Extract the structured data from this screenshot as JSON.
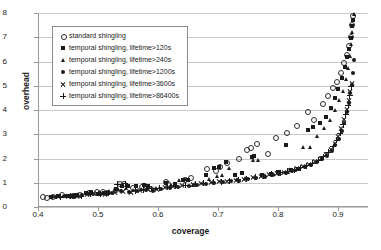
{
  "chart_data": {
    "type": "scatter",
    "title": "",
    "xlabel": "coverage",
    "ylabel": "overhead",
    "xlim": [
      0.4,
      0.95
    ],
    "ylim": [
      0,
      8
    ],
    "xticks": [
      "0.4",
      "0.5",
      "0.6",
      "0.7",
      "0.8",
      "0.9"
    ],
    "xtick_values": [
      0.4,
      0.5,
      0.6,
      0.7,
      0.8,
      0.9
    ],
    "yticks": [
      "0",
      "1",
      "2",
      "3",
      "4",
      "5",
      "6",
      "7",
      "8"
    ],
    "ytick_values": [
      0,
      1,
      2,
      3,
      4,
      5,
      6,
      7,
      8
    ],
    "grid": "horizontal",
    "legend_position": "upper-left-inside",
    "series": [
      {
        "name": "standard shingling",
        "marker": "circle-open",
        "color": "#1a1a1a",
        "points": [
          [
            0.405,
            0.42
          ],
          [
            0.413,
            0.4
          ],
          [
            0.422,
            0.45
          ],
          [
            0.437,
            0.5
          ],
          [
            0.455,
            0.47
          ],
          [
            0.468,
            0.52
          ],
          [
            0.482,
            0.58
          ],
          [
            0.495,
            0.62
          ],
          [
            0.505,
            0.63
          ],
          [
            0.512,
            0.6
          ],
          [
            0.527,
            0.72
          ],
          [
            0.534,
            0.95
          ],
          [
            0.541,
            0.98
          ],
          [
            0.556,
            0.8
          ],
          [
            0.571,
            0.83
          ],
          [
            0.585,
            0.78
          ],
          [
            0.61,
            1.05
          ],
          [
            0.614,
            0.97
          ],
          [
            0.642,
            1.12
          ],
          [
            0.652,
            1.2
          ],
          [
            0.679,
            1.58
          ],
          [
            0.694,
            1.52
          ],
          [
            0.7,
            1.68
          ],
          [
            0.713,
            1.85
          ],
          [
            0.732,
            2.02
          ],
          [
            0.745,
            2.38
          ],
          [
            0.752,
            2.45
          ],
          [
            0.763,
            2.62
          ],
          [
            0.781,
            2.22
          ],
          [
            0.794,
            2.88
          ],
          [
            0.812,
            3.08
          ],
          [
            0.829,
            3.36
          ],
          [
            0.847,
            3.92
          ],
          [
            0.858,
            3.62
          ],
          [
            0.872,
            4.25
          ],
          [
            0.881,
            4.58
          ],
          [
            0.889,
            4.92
          ],
          [
            0.896,
            5.18
          ],
          [
            0.903,
            5.55
          ],
          [
            0.908,
            5.95
          ],
          [
            0.912,
            6.28
          ],
          [
            0.916,
            6.65
          ],
          [
            0.919,
            7.05
          ],
          [
            0.921,
            7.52
          ],
          [
            0.923,
            7.88
          ]
        ]
      },
      {
        "name": "temporal shingling, lifetime>120s",
        "marker": "square-filled",
        "color": "#1a1a1a",
        "points": [
          [
            0.42,
            0.42
          ],
          [
            0.432,
            0.44
          ],
          [
            0.448,
            0.46
          ],
          [
            0.455,
            0.45
          ],
          [
            0.462,
            0.5
          ],
          [
            0.478,
            0.57
          ],
          [
            0.487,
            0.6
          ],
          [
            0.498,
            0.55
          ],
          [
            0.508,
            0.58
          ],
          [
            0.515,
            0.59
          ],
          [
            0.528,
            0.73
          ],
          [
            0.538,
            0.85
          ],
          [
            0.548,
            0.88
          ],
          [
            0.562,
            0.87
          ],
          [
            0.575,
            0.9
          ],
          [
            0.582,
            0.86
          ],
          [
            0.612,
            0.98
          ],
          [
            0.626,
            0.93
          ],
          [
            0.64,
            1.13
          ],
          [
            0.648,
            1.1
          ],
          [
            0.678,
            1.33
          ],
          [
            0.692,
            1.62
          ],
          [
            0.7,
            1.66
          ],
          [
            0.712,
            1.85
          ],
          [
            0.726,
            1.3
          ],
          [
            0.738,
            1.42
          ],
          [
            0.755,
            2.08
          ],
          [
            0.758,
            2.12
          ],
          [
            0.772,
            1.34
          ],
          [
            0.786,
            1.38
          ],
          [
            0.798,
            1.43
          ],
          [
            0.812,
            2.55
          ],
          [
            0.82,
            1.52
          ],
          [
            0.832,
            1.58
          ],
          [
            0.848,
            3.18
          ],
          [
            0.856,
            3.28
          ],
          [
            0.868,
            3.45
          ],
          [
            0.878,
            3.7
          ],
          [
            0.886,
            4.1
          ],
          [
            0.893,
            4.48
          ],
          [
            0.899,
            4.85
          ],
          [
            0.905,
            5.3
          ],
          [
            0.91,
            5.78
          ],
          [
            0.914,
            6.18
          ],
          [
            0.917,
            6.52
          ],
          [
            0.92,
            6.95
          ],
          [
            0.922,
            7.45
          ],
          [
            0.924,
            7.72
          ]
        ]
      },
      {
        "name": "temporal shingling, lifetime>240s",
        "marker": "triangle-filled",
        "color": "#1a1a1a",
        "points": [
          [
            0.424,
            0.43
          ],
          [
            0.44,
            0.45
          ],
          [
            0.452,
            0.44
          ],
          [
            0.466,
            0.52
          ],
          [
            0.484,
            0.56
          ],
          [
            0.5,
            0.58
          ],
          [
            0.518,
            0.62
          ],
          [
            0.532,
            0.74
          ],
          [
            0.546,
            0.78
          ],
          [
            0.558,
            0.68
          ],
          [
            0.57,
            0.72
          ],
          [
            0.584,
            0.8
          ],
          [
            0.596,
            0.75
          ],
          [
            0.62,
            0.9
          ],
          [
            0.634,
            1.08
          ],
          [
            0.646,
            1.12
          ],
          [
            0.658,
            0.88
          ],
          [
            0.684,
            1.12
          ],
          [
            0.698,
            1.27
          ],
          [
            0.706,
            1.3
          ],
          [
            0.718,
            1.58
          ],
          [
            0.73,
            1.12
          ],
          [
            0.744,
            1.16
          ],
          [
            0.758,
            1.92
          ],
          [
            0.766,
            1.9
          ],
          [
            0.778,
            1.28
          ],
          [
            0.79,
            1.33
          ],
          [
            0.802,
            1.38
          ],
          [
            0.816,
            1.44
          ],
          [
            0.828,
            1.5
          ],
          [
            0.84,
            2.45
          ],
          [
            0.852,
            2.47
          ],
          [
            0.864,
            2.9
          ],
          [
            0.876,
            3.22
          ],
          [
            0.886,
            3.58
          ],
          [
            0.894,
            3.98
          ],
          [
            0.901,
            4.38
          ],
          [
            0.907,
            4.78
          ],
          [
            0.912,
            5.25
          ],
          [
            0.916,
            5.72
          ],
          [
            0.919,
            6.22
          ],
          [
            0.921,
            6.7
          ],
          [
            0.923,
            7.18
          ],
          [
            0.925,
            7.95
          ]
        ]
      },
      {
        "name": "temporal shingling, lifetime>1200s",
        "marker": "circle-filled",
        "color": "#1a1a1a",
        "points": [
          [
            0.428,
            0.42
          ],
          [
            0.444,
            0.44
          ],
          [
            0.458,
            0.43
          ],
          [
            0.472,
            0.5
          ],
          [
            0.49,
            0.54
          ],
          [
            0.504,
            0.52
          ],
          [
            0.522,
            0.58
          ],
          [
            0.536,
            0.66
          ],
          [
            0.55,
            0.62
          ],
          [
            0.564,
            0.64
          ],
          [
            0.578,
            0.7
          ],
          [
            0.59,
            0.68
          ],
          [
            0.604,
            0.76
          ],
          [
            0.618,
            0.78
          ],
          [
            0.632,
            0.82
          ],
          [
            0.65,
            0.88
          ],
          [
            0.664,
            0.9
          ],
          [
            0.678,
            0.95
          ],
          [
            0.692,
            0.98
          ],
          [
            0.706,
            1.03
          ],
          [
            0.72,
            1.06
          ],
          [
            0.734,
            1.09
          ],
          [
            0.748,
            1.14
          ],
          [
            0.762,
            1.18
          ],
          [
            0.776,
            1.24
          ],
          [
            0.79,
            1.32
          ],
          [
            0.8,
            1.36
          ],
          [
            0.812,
            1.42
          ],
          [
            0.822,
            1.48
          ],
          [
            0.834,
            1.56
          ],
          [
            0.844,
            1.63
          ],
          [
            0.854,
            1.72
          ],
          [
            0.864,
            1.84
          ],
          [
            0.872,
            1.96
          ],
          [
            0.88,
            2.12
          ],
          [
            0.888,
            2.32
          ],
          [
            0.894,
            2.55
          ],
          [
            0.9,
            2.82
          ],
          [
            0.905,
            3.15
          ],
          [
            0.909,
            3.48
          ],
          [
            0.913,
            3.92
          ],
          [
            0.916,
            4.28
          ],
          [
            0.919,
            4.72
          ],
          [
            0.921,
            5.05
          ],
          [
            0.923,
            5.52
          ],
          [
            0.925,
            6.05
          ]
        ]
      },
      {
        "name": "temporal shingling, lifetime>3600s",
        "marker": "cross",
        "color": "#1a1a1a",
        "points": [
          [
            0.432,
            0.42
          ],
          [
            0.448,
            0.45
          ],
          [
            0.464,
            0.44
          ],
          [
            0.48,
            0.52
          ],
          [
            0.496,
            0.54
          ],
          [
            0.51,
            0.53
          ],
          [
            0.526,
            0.6
          ],
          [
            0.54,
            0.62
          ],
          [
            0.554,
            0.6
          ],
          [
            0.568,
            0.66
          ],
          [
            0.582,
            0.72
          ],
          [
            0.596,
            0.74
          ],
          [
            0.61,
            0.8
          ],
          [
            0.624,
            0.84
          ],
          [
            0.638,
            0.88
          ],
          [
            0.656,
            0.92
          ],
          [
            0.67,
            0.96
          ],
          [
            0.686,
            1.0
          ],
          [
            0.7,
            1.04
          ],
          [
            0.714,
            1.07
          ],
          [
            0.728,
            1.1
          ],
          [
            0.742,
            1.15
          ],
          [
            0.756,
            1.2
          ],
          [
            0.77,
            1.26
          ],
          [
            0.784,
            1.33
          ],
          [
            0.796,
            1.38
          ],
          [
            0.808,
            1.44
          ],
          [
            0.818,
            1.5
          ],
          [
            0.83,
            1.58
          ],
          [
            0.84,
            1.66
          ],
          [
            0.85,
            1.75
          ],
          [
            0.86,
            1.86
          ],
          [
            0.87,
            2.0
          ],
          [
            0.878,
            2.16
          ],
          [
            0.886,
            2.38
          ],
          [
            0.893,
            2.62
          ],
          [
            0.899,
            2.92
          ],
          [
            0.904,
            3.22
          ],
          [
            0.909,
            3.62
          ],
          [
            0.913,
            4.02
          ],
          [
            0.916,
            4.4
          ],
          [
            0.919,
            4.78
          ],
          [
            0.921,
            5.1
          ]
        ]
      },
      {
        "name": "temporal shingling, lifetime>86400s",
        "marker": "plus",
        "color": "#1a1a1a",
        "points": [
          [
            0.436,
            0.43
          ],
          [
            0.452,
            0.46
          ],
          [
            0.47,
            0.45
          ],
          [
            0.486,
            0.53
          ],
          [
            0.502,
            0.55
          ],
          [
            0.516,
            0.56
          ],
          [
            0.53,
            0.94
          ],
          [
            0.544,
            0.96
          ],
          [
            0.56,
            0.66
          ],
          [
            0.574,
            0.7
          ],
          [
            0.588,
            0.76
          ],
          [
            0.6,
            0.78
          ],
          [
            0.614,
            0.82
          ],
          [
            0.628,
            0.86
          ],
          [
            0.644,
            0.9
          ],
          [
            0.66,
            0.94
          ],
          [
            0.674,
            0.98
          ],
          [
            0.69,
            1.02
          ],
          [
            0.704,
            1.05
          ],
          [
            0.718,
            1.08
          ],
          [
            0.732,
            1.12
          ],
          [
            0.746,
            1.17
          ],
          [
            0.76,
            1.22
          ],
          [
            0.774,
            1.28
          ],
          [
            0.788,
            1.35
          ],
          [
            0.802,
            1.41
          ],
          [
            0.814,
            1.47
          ],
          [
            0.826,
            1.54
          ],
          [
            0.836,
            1.62
          ],
          [
            0.846,
            1.7
          ],
          [
            0.856,
            1.8
          ],
          [
            0.866,
            1.93
          ],
          [
            0.874,
            2.08
          ],
          [
            0.882,
            2.26
          ],
          [
            0.89,
            2.48
          ],
          [
            0.896,
            2.75
          ],
          [
            0.902,
            3.05
          ],
          [
            0.907,
            3.4
          ],
          [
            0.911,
            3.8
          ],
          [
            0.915,
            4.2
          ],
          [
            0.918,
            4.58
          ],
          [
            0.92,
            4.95
          ]
        ]
      }
    ]
  }
}
